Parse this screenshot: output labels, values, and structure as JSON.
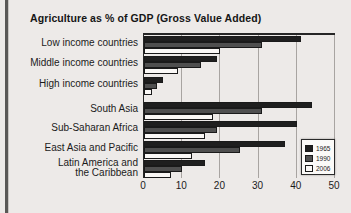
{
  "page": {
    "background": "#edeae8",
    "left_rule_color": "#5a5856"
  },
  "chart_data": {
    "type": "bar",
    "orientation": "horizontal",
    "title": "Agriculture as % of GDP (Gross Value Added)",
    "categories": [
      "Low income countries",
      "Middle income countries",
      "High income countries",
      "South Asia",
      "Sub-Saharan Africa",
      "East Asia and Pacific",
      "Latin America and\nthe Caribbean"
    ],
    "series": [
      {
        "name": "1965",
        "color": "#1f1f1f",
        "values": [
          41,
          19,
          5,
          44,
          40,
          37,
          16
        ]
      },
      {
        "name": "1990",
        "color": "#4f4f4f",
        "values": [
          31,
          15,
          3.5,
          31,
          19,
          25,
          10
        ]
      },
      {
        "name": "2006",
        "color": "#faf8f6",
        "values": [
          20,
          9,
          2,
          18,
          16,
          12.5,
          7
        ]
      }
    ],
    "xlabel": "",
    "ylabel": "",
    "xlim": [
      0,
      50
    ],
    "x_ticks": [
      0,
      10,
      20,
      30,
      40,
      50
    ],
    "grid": true,
    "gridline_color": "#a8a4a1",
    "axis_color": "#262626",
    "legend_position": "inside-bottom-right"
  }
}
